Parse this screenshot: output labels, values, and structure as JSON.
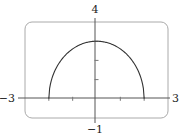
{
  "chart_data": {
    "type": "line",
    "title": "",
    "xlabel": "",
    "ylabel": "",
    "xlim": [
      -3,
      3
    ],
    "ylim": [
      -1,
      4
    ],
    "grid": false,
    "legend": "none",
    "window_labels": {
      "xmin": "−3",
      "xmax": "3",
      "ymin": "−1",
      "ymax": "4"
    },
    "x_ticks": [
      -2,
      -1,
      0,
      1,
      2
    ],
    "y_ticks": [
      1,
      2,
      3
    ],
    "series": [
      {
        "name": "upper half-ellipse",
        "expression": "y = 1.5*sqrt(4 - x^2)",
        "x": [
          -2,
          -1.5,
          -1,
          -0.5,
          0,
          0.5,
          1,
          1.5,
          2
        ],
        "y": [
          0,
          1.98,
          2.6,
          2.9,
          3,
          2.9,
          2.6,
          1.98,
          0
        ]
      }
    ],
    "colors": {
      "curve": "#333333",
      "axes": "#555555",
      "frame": "#aaaaaa"
    }
  }
}
